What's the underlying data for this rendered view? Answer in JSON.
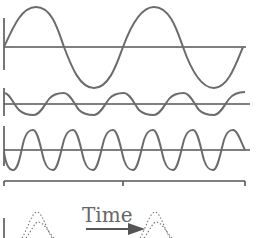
{
  "diagram": {
    "title": "",
    "time_label": "Time",
    "colors": {
      "wave": "#6b6b6b",
      "axis": "#555555",
      "arrow": "#555555",
      "text": "#666666"
    },
    "waves": [
      {
        "name": "low-frequency-wave",
        "baseline_y": 47,
        "amplitude": 40,
        "period_px": 119,
        "phase": "sine",
        "x_start": 4,
        "x_end": 243
      },
      {
        "name": "mid-frequency-wave",
        "baseline_y": 104,
        "amplitude": 10,
        "period_px": 60,
        "phase": "cosine-like",
        "x_start": 4,
        "x_end": 245
      },
      {
        "name": "high-frequency-wave",
        "baseline_y": 150,
        "amplitude": 20,
        "period_px": 40,
        "phase": "negative-sine",
        "x_start": 4,
        "x_end": 245
      }
    ],
    "time_axis": {
      "y": 181,
      "x_start": 4,
      "x_end": 245,
      "ticks": [
        4,
        123,
        245
      ]
    },
    "pulses": [
      {
        "name": "pulse-before",
        "center_x": 37
      },
      {
        "name": "pulse-after",
        "center_x": 155
      }
    ]
  }
}
